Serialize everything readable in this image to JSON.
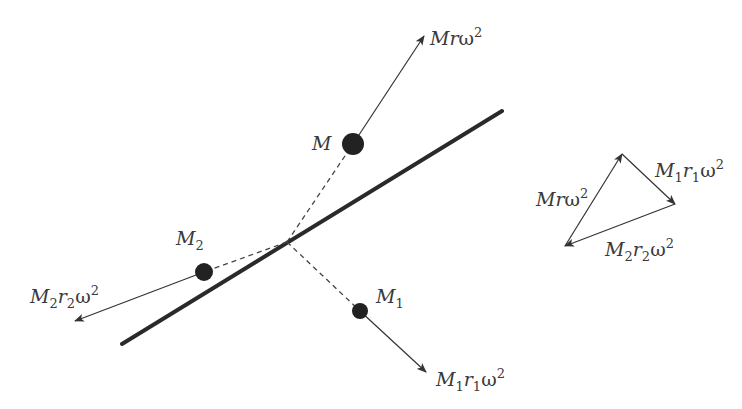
{
  "diagram": {
    "colors": {
      "shaft": "#2a2a2a",
      "mass": "#222222",
      "arrow": "#333333",
      "dashed": "#444444",
      "text": "#3a3a3a",
      "background": "#ffffff"
    },
    "shaft": {
      "x1": 122,
      "y1": 344,
      "x2": 502,
      "y2": 111,
      "width": 4
    },
    "pivot": {
      "x": 287,
      "y": 242
    },
    "masses": [
      {
        "id": "M",
        "label": "M",
        "subscript": "",
        "cx": 353,
        "cy": 144,
        "r": 11,
        "label_pos": {
          "x": 312,
          "y": 150
        },
        "force": {
          "label_parts": [
            "M",
            "r",
            "",
            "ω",
            "2"
          ],
          "tip": {
            "x": 424,
            "y": 36
          },
          "label_pos": {
            "x": 430,
            "y": 44
          }
        }
      },
      {
        "id": "M2",
        "label": "M",
        "subscript": "2",
        "cx": 204,
        "cy": 272,
        "r": 9,
        "label_pos": {
          "x": 176,
          "y": 244
        },
        "force": {
          "label_parts": [
            "M",
            "r",
            "2",
            "ω",
            "2"
          ],
          "tip": {
            "x": 75,
            "y": 321
          },
          "label_pos": {
            "x": 30,
            "y": 303
          }
        }
      },
      {
        "id": "M1",
        "label": "M",
        "subscript": "1",
        "cx": 360,
        "cy": 311,
        "r": 8,
        "label_pos": {
          "x": 377,
          "y": 303
        },
        "force": {
          "label_parts": [
            "M",
            "r",
            "1",
            "ω",
            "2"
          ],
          "tip": {
            "x": 426,
            "y": 372
          },
          "label_pos": {
            "x": 436,
            "y": 385
          }
        }
      }
    ],
    "force_polygon": {
      "vertices": {
        "top": {
          "x": 622,
          "y": 154
        },
        "right": {
          "x": 675,
          "y": 204
        },
        "bottom_left": {
          "x": 565,
          "y": 246
        }
      },
      "sides": [
        {
          "from": "bottom_left",
          "to": "top",
          "label": "Mrω²",
          "label_pos": {
            "x": 536,
            "y": 206
          }
        },
        {
          "from": "top",
          "to": "right",
          "label": "M₁r₁ω²",
          "label_pos": {
            "x": 656,
            "y": 178
          }
        },
        {
          "from": "right",
          "to": "bottom_left",
          "label": "M₂r₂ω²",
          "label_pos": {
            "x": 606,
            "y": 256
          }
        }
      ]
    },
    "text": {
      "mass_M": "M",
      "mass_M2_base": "M",
      "mass_M2_sub": "2",
      "mass_M1_base": "M",
      "mass_M1_sub": "1",
      "force_M": {
        "a": "M",
        "b": "r",
        "w": "ω",
        "sup": "2"
      },
      "force_M2": {
        "a": "M",
        "a_sub": "2",
        "b": "r",
        "b_sub": "2",
        "w": "ω",
        "sup": "2"
      },
      "force_M1": {
        "a": "M",
        "a_sub": "1",
        "b": "r",
        "b_sub": "1",
        "w": "ω",
        "sup": "2"
      }
    }
  }
}
